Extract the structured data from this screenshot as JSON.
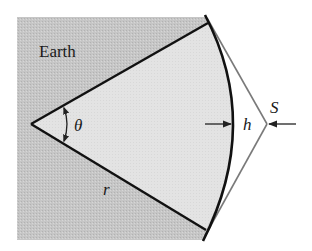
{
  "figure": {
    "labels": {
      "earth": "Earth",
      "angle": "θ",
      "radius": "r",
      "height": "h",
      "satellite": "S"
    },
    "colors": {
      "earth_fill": "#c4c4c4",
      "sector_fill": "#e2e2e2",
      "background": "#ffffff",
      "line_dark": "#111111",
      "line_gray": "#7a7a7a"
    },
    "geometry": {
      "vertex": [
        31,
        124
      ],
      "upper_radius_end": [
        208,
        23
      ],
      "lower_radius_end": [
        206,
        230
      ],
      "arc_apex": [
        233,
        124
      ],
      "satellite_point": [
        267,
        124
      ]
    }
  }
}
